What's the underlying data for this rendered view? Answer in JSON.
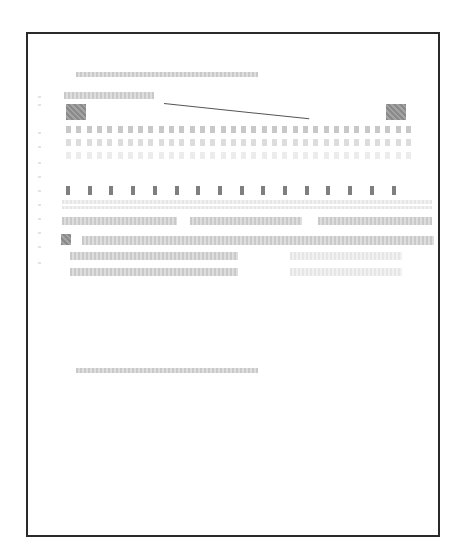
{
  "document": {
    "legible_text": [],
    "note": ""
  }
}
